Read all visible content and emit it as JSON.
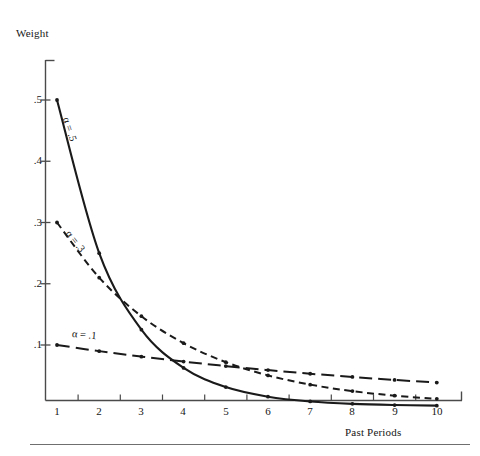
{
  "chart_data": {
    "type": "line",
    "title": "",
    "xlabel": "Past Periods",
    "ylabel": "Weight",
    "x": [
      1,
      2,
      3,
      4,
      5,
      6,
      7,
      8,
      9,
      10
    ],
    "xlim": [
      0.6,
      10.6
    ],
    "ylim": [
      0.012,
      0.567
    ],
    "xtick_labels": [
      "1",
      "2",
      "3",
      "4",
      "5",
      "6",
      "7",
      "8",
      "9",
      "10"
    ],
    "ytick_labels": [
      ".5",
      ".4",
      ".3",
      ".2",
      ".1"
    ],
    "ytick_values": [
      0.5,
      0.4,
      0.3,
      0.2,
      0.1
    ],
    "grid": false,
    "legend_position": "inline-curve-labels",
    "series": [
      {
        "name": "alpha-0.5",
        "label": "α = .5",
        "alpha": 0.5,
        "style": "solid",
        "color": "#1a1a1a",
        "values": [
          0.5,
          0.25,
          0.125,
          0.0625,
          0.0313,
          0.0156,
          0.0078,
          0.0039,
          0.002,
          0.001
        ]
      },
      {
        "name": "alpha-0.3",
        "label": "α = .3",
        "alpha": 0.3,
        "style": "short-dash",
        "color": "#1a1a1a",
        "values": [
          0.3,
          0.21,
          0.147,
          0.1029,
          0.072,
          0.0504,
          0.0353,
          0.0247,
          0.0173,
          0.0121
        ]
      },
      {
        "name": "alpha-0.1",
        "label": "α = .1",
        "alpha": 0.1,
        "style": "long-dash",
        "color": "#1a1a1a",
        "values": [
          0.1,
          0.09,
          0.081,
          0.0729,
          0.0656,
          0.059,
          0.0531,
          0.0478,
          0.043,
          0.0387
        ]
      }
    ]
  },
  "figure": {
    "ylabel": "Weight",
    "xlabel": "Past Periods",
    "series_labels": {
      "a5": "α = .5",
      "a3": "α = .3",
      "a1": "α = .1"
    },
    "axis_color": "#4a4a4a",
    "curve_color": "#1a1a1a"
  }
}
